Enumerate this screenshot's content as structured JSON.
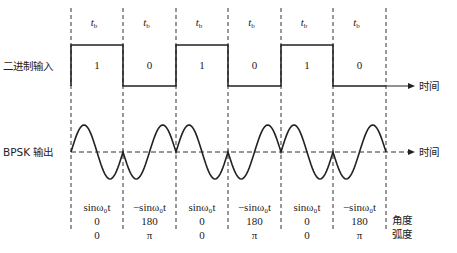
{
  "diagram": {
    "type": "BPSK modulation waveform",
    "bit_period_label": "t",
    "bit_period_subscript": "b",
    "binary_input_label": "二进制输入",
    "bpsk_output_label": "BPSK 输出",
    "time_axis_label": "时间",
    "bits": [
      "1",
      "0",
      "1",
      "0",
      "1",
      "0"
    ],
    "signals": [
      "sinω₀t",
      "−sinω₀t",
      "sinω₀t",
      "−sinω₀t",
      "sinω₀t",
      "−sinω₀t"
    ],
    "angles_deg": [
      "0",
      "180",
      "0",
      "180",
      "0",
      "180"
    ],
    "angles_rad": [
      "0",
      "π",
      "0",
      "π",
      "0",
      "π"
    ],
    "angle_row_label": "角度",
    "radian_row_label": "弧度",
    "boundaries_x": [
      71,
      123,
      176,
      228,
      281,
      333,
      386
    ],
    "colors": {
      "line": "#222222",
      "background": "#ffffff"
    }
  }
}
